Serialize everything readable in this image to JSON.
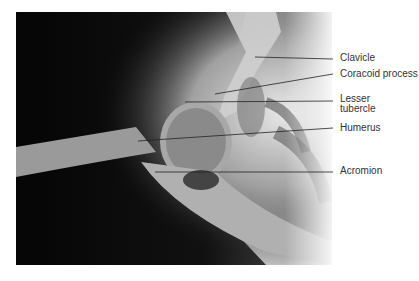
{
  "figure": {
    "labels": [
      {
        "text": "Clavicle",
        "y": 53
      },
      {
        "text": "Coracoid process",
        "y": 69
      },
      {
        "text": "Lesser",
        "y": 94
      },
      {
        "text": "tubercle",
        "y": 104
      },
      {
        "text": "Humerus",
        "y": 123
      },
      {
        "text": "Acromion",
        "y": 166
      }
    ]
  }
}
